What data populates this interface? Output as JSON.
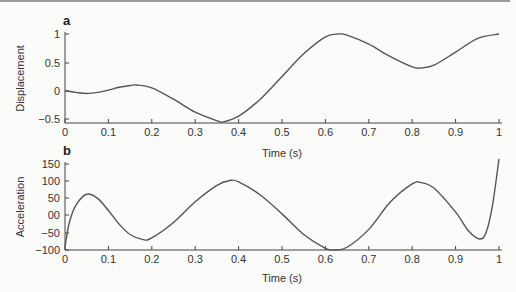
{
  "chart_data": [
    {
      "panel": "a",
      "type": "line",
      "title": "",
      "xlabel": "Time (s)",
      "ylabel": "Displacement",
      "xlim": [
        0,
        1
      ],
      "ylim": [
        -0.55,
        1
      ],
      "xticks": [
        "0",
        "0.1",
        "0.2",
        "0.3",
        "0.4",
        "0.5",
        "0.6",
        "0.7",
        "0.8",
        "0.9",
        "1"
      ],
      "yticks": [
        "1",
        "0.5",
        "0",
        "−0.5"
      ],
      "grid": false,
      "x": [
        0,
        0.025,
        0.05,
        0.075,
        0.1,
        0.125,
        0.15,
        0.165,
        0.2,
        0.25,
        0.3,
        0.35,
        0.365,
        0.4,
        0.45,
        0.5,
        0.55,
        0.6,
        0.63,
        0.65,
        0.7,
        0.75,
        0.8,
        0.82,
        0.85,
        0.9,
        0.95,
        1.0
      ],
      "values": [
        0.0,
        -0.03,
        -0.05,
        -0.03,
        0.01,
        0.06,
        0.09,
        0.1,
        0.05,
        -0.15,
        -0.38,
        -0.53,
        -0.55,
        -0.45,
        -0.15,
        0.25,
        0.65,
        0.95,
        1.0,
        0.98,
        0.82,
        0.6,
        0.42,
        0.4,
        0.45,
        0.68,
        0.92,
        1.0
      ]
    },
    {
      "panel": "b",
      "type": "line",
      "title": "",
      "xlabel": "Time (s)",
      "ylabel": "Acceleration",
      "xlim": [
        0,
        1
      ],
      "ylim": [
        -100,
        160
      ],
      "xticks": [
        "0",
        "0.1",
        "0.2",
        "0.3",
        "0.4",
        "0.5",
        "0.6",
        "0.7",
        "0.8",
        "0.9",
        "1"
      ],
      "yticks": [
        "150",
        "100",
        "50",
        "00",
        "−50",
        "−100"
      ],
      "grid": false,
      "x": [
        0,
        0.01,
        0.025,
        0.05,
        0.075,
        0.1,
        0.125,
        0.15,
        0.18,
        0.2,
        0.25,
        0.3,
        0.35,
        0.38,
        0.4,
        0.45,
        0.5,
        0.55,
        0.6,
        0.62,
        0.65,
        0.7,
        0.75,
        0.8,
        0.82,
        0.85,
        0.9,
        0.93,
        0.955,
        0.97,
        0.985,
        1.0
      ],
      "values": [
        -90,
        -20,
        30,
        62,
        50,
        15,
        -25,
        -55,
        -70,
        -65,
        -20,
        40,
        88,
        102,
        98,
        60,
        5,
        -55,
        -95,
        -100,
        -92,
        -40,
        40,
        92,
        96,
        80,
        10,
        -45,
        -68,
        -50,
        30,
        165
      ]
    }
  ],
  "panels": {
    "a": {
      "label": "a"
    },
    "b": {
      "label": "b"
    }
  },
  "colors": {
    "line": "#555555",
    "axis": "#444444",
    "text": "#333333"
  }
}
